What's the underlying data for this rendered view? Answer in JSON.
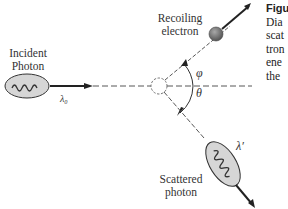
{
  "diagram": {
    "type": "compton-scattering",
    "labels": {
      "incident": [
        "Incident",
        "Photon"
      ],
      "incident_wavelength": "λ₀",
      "recoil": [
        "Recoiling",
        "electron"
      ],
      "scattered": [
        "Scattered",
        "photon"
      ],
      "scattered_wavelength": "λ′",
      "phi": "φ",
      "theta": "θ"
    },
    "colors": {
      "line": "#2a2a2a",
      "photon_fill": "#d4d4d4",
      "electron_fill": "#7a7a7a"
    }
  },
  "caption": {
    "title": "Figu",
    "lines": [
      "Dia",
      "scat",
      "tron",
      "ene",
      "the"
    ]
  }
}
